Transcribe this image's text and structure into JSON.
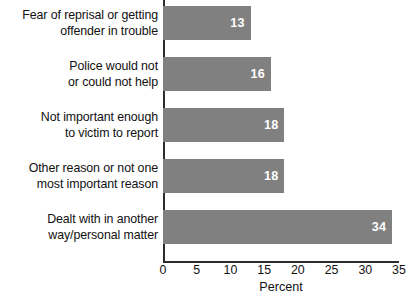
{
  "chart_data": {
    "type": "bar",
    "orientation": "horizontal",
    "title": "",
    "xlabel": "Percent",
    "ylabel": "",
    "xlim": [
      0,
      35
    ],
    "xticks": [
      0,
      5,
      10,
      15,
      20,
      25,
      30,
      35
    ],
    "grid": false,
    "legend": false,
    "bar_color": "#808080",
    "value_label_color": "#ffffff",
    "axis_color": "#2b2b2b",
    "categories": [
      "Fear of reprisal or getting\noffender in trouble",
      "Police would not\nor could not help",
      "Not important enough\nto victim to report",
      "Other reason or not one\nmost important reason",
      "Dealt with in another\nway/personal matter"
    ],
    "values": [
      13,
      16,
      18,
      18,
      34
    ],
    "value_labels": [
      "13",
      "16",
      "18",
      "18",
      "34"
    ]
  }
}
